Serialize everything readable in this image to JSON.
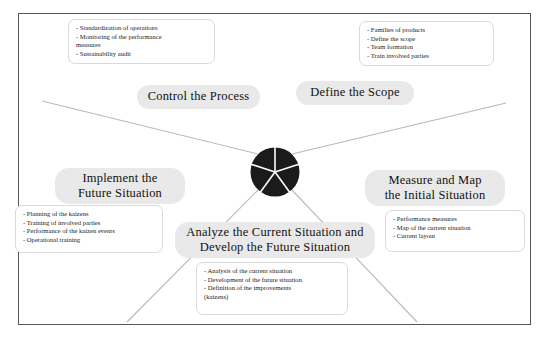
{
  "diagram": {
    "frame_color": "#54565a",
    "hub_color": "#1b1b1b",
    "pill_color": "#e9e9e9",
    "spoke_color": "#b8b8b8",
    "hub": {
      "center_x": 275,
      "center_y": 172,
      "radius": 25,
      "segments": 5
    },
    "phases": [
      {
        "key": "control",
        "label": "Control the Process",
        "label_lines": [
          "Control the Process"
        ],
        "bullets": [
          "- Standardization of operations",
          "- Monitoring of the performance",
          "measures",
          "- Sustainability audit"
        ]
      },
      {
        "key": "define",
        "label": "Define the Scope",
        "label_lines": [
          "Define the Scope"
        ],
        "bullets": [
          "- Families of products",
          "- Define the scope",
          "- Team formation",
          "- Train involved parties"
        ]
      },
      {
        "key": "measure",
        "label": "Measure and Map the Initial Situation",
        "label_lines": [
          "Measure and Map",
          "the Initial Situation"
        ],
        "bullets": [
          "- Performance measures",
          "- Map of the current situation",
          "- Current layout"
        ]
      },
      {
        "key": "analyze",
        "label": "Analyze the Current Situation and Develop the Future Situation",
        "label_lines": [
          "Analyze the Current Situation and",
          "Develop the Future Situation"
        ],
        "bullets": [
          "- Analysis of the current situation",
          "- Development of the future situation",
          "- Definition of the improvements",
          "(kaizens)"
        ]
      },
      {
        "key": "implement",
        "label": "Implement the Future Situation",
        "label_lines": [
          "Implement the",
          "Future Situation"
        ],
        "bullets": [
          "- Planning of the kaizens",
          "- Training of involved parties",
          "- Performance of the kaizen events",
          "- Operational training"
        ]
      }
    ]
  }
}
